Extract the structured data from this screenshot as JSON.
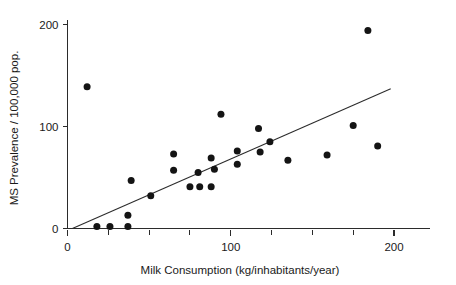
{
  "chart_data": {
    "type": "scatter",
    "title": "",
    "xlabel": "Milk Consumption (kg/inhabitants/year)",
    "ylabel": "MS Prevalence / 100,000 pop.",
    "xlim": [
      0,
      215
    ],
    "ylim": [
      0,
      205
    ],
    "xticks": [
      0,
      100,
      200
    ],
    "xticklabels": [
      "0",
      "100",
      "200"
    ],
    "xminorticks": [
      25,
      50,
      75,
      125,
      150,
      175
    ],
    "yticks": [
      0,
      100,
      200
    ],
    "yticklabels": [
      "0",
      "100",
      "200"
    ],
    "grid": false,
    "legend": null,
    "points": [
      {
        "x": 12,
        "y": 139
      },
      {
        "x": 18,
        "y": 2
      },
      {
        "x": 26,
        "y": 2
      },
      {
        "x": 37,
        "y": 2
      },
      {
        "x": 37,
        "y": 13
      },
      {
        "x": 39,
        "y": 47
      },
      {
        "x": 51,
        "y": 32
      },
      {
        "x": 65,
        "y": 73
      },
      {
        "x": 65,
        "y": 57
      },
      {
        "x": 75,
        "y": 41
      },
      {
        "x": 80,
        "y": 55
      },
      {
        "x": 81,
        "y": 41
      },
      {
        "x": 88,
        "y": 41
      },
      {
        "x": 88,
        "y": 69
      },
      {
        "x": 90,
        "y": 58
      },
      {
        "x": 94,
        "y": 112
      },
      {
        "x": 104,
        "y": 63
      },
      {
        "x": 104,
        "y": 76
      },
      {
        "x": 117,
        "y": 98
      },
      {
        "x": 118,
        "y": 75
      },
      {
        "x": 124,
        "y": 85
      },
      {
        "x": 135,
        "y": 67
      },
      {
        "x": 159,
        "y": 72
      },
      {
        "x": 175,
        "y": 101
      },
      {
        "x": 184,
        "y": 194
      },
      {
        "x": 190,
        "y": 81
      }
    ],
    "trend_line": {
      "label": "linear fit",
      "x0": 3,
      "y0": 0,
      "x1": 198,
      "y1": 137
    }
  }
}
